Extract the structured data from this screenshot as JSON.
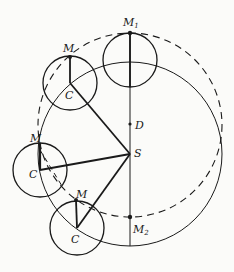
{
  "diagram": {
    "type": "geometry",
    "colors": {
      "stroke": "#1a1a1a",
      "background": "#fbfbf9"
    },
    "big_circle_solid": {
      "center_label": "S",
      "cx": 130,
      "cy": 154,
      "r": 92
    },
    "big_circle_dashed": {
      "center_label": "D",
      "cx": 130,
      "cy": 125,
      "r": 92
    },
    "vertical_axis": {
      "x": 130,
      "y1": 33,
      "y2": 246
    },
    "points": {
      "M1": {
        "label": "M",
        "sub": "1",
        "x": 130,
        "y": 33
      },
      "M2": {
        "label": "M",
        "sub": "2",
        "x": 130,
        "y": 217
      },
      "D": {
        "label": "D",
        "x": 130,
        "y": 124
      },
      "S": {
        "label": "S",
        "x": 130,
        "y": 154
      }
    },
    "small_circles": [
      {
        "name": "top",
        "cx": 130,
        "cy": 60,
        "r": 27,
        "m_x": 130,
        "m_y": 33,
        "c_label": "",
        "m_label": ""
      },
      {
        "name": "upper-left",
        "cx": 70,
        "cy": 83,
        "r": 27,
        "m_x": 70,
        "m_y": 57,
        "c_label": "C",
        "m_label": "M"
      },
      {
        "name": "middle-left",
        "cx": 40,
        "cy": 170,
        "r": 27,
        "m_x": 40,
        "m_y": 143,
        "c_label": "C",
        "m_label": "M"
      },
      {
        "name": "bottom",
        "cx": 77,
        "cy": 228,
        "r": 27,
        "m_x": 76,
        "m_y": 200,
        "c_label": "C",
        "m_label": "M"
      }
    ],
    "labels": {
      "M1_main": "M",
      "M1_sub": "1",
      "M2_main": "M",
      "M2_sub": "2",
      "D": "D",
      "S": "S",
      "M_upper_left": "M",
      "C_upper_left": "C",
      "M_middle_left": "M",
      "C_middle_left": "C",
      "M_bottom": "M",
      "C_bottom": "C"
    }
  }
}
